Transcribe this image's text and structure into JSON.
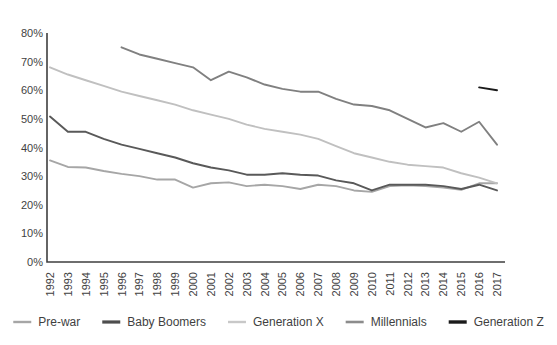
{
  "chart_data": {
    "type": "line",
    "title": "",
    "subtitle": "",
    "xlabel": "",
    "ylabel": "",
    "ylim": [
      0,
      0.8
    ],
    "grid": false,
    "legend_position": "bottom",
    "y_tick_labels": [
      "0%",
      "10%",
      "20%",
      "30%",
      "40%",
      "50%",
      "60%",
      "70%",
      "80%"
    ],
    "y_tick_values": [
      0,
      10,
      20,
      30,
      40,
      50,
      60,
      70,
      80
    ],
    "categories": [
      "1992",
      "1993",
      "1994",
      "1995",
      "1996",
      "1997",
      "1998",
      "1999",
      "2000",
      "2001",
      "2002",
      "2003",
      "2004",
      "2005",
      "2006",
      "2007",
      "2008",
      "2009",
      "2010",
      "2011",
      "2012",
      "2013",
      "2014",
      "2015",
      "2016",
      "2017"
    ],
    "series": [
      {
        "name": "Pre-war",
        "color": "#a6a6a6",
        "values": [
          35.5,
          33.2,
          33.0,
          31.8,
          30.8,
          30.0,
          28.8,
          28.8,
          26.0,
          27.5,
          27.8,
          26.5,
          27.0,
          26.5,
          25.5,
          27.0,
          26.5,
          25.0,
          24.5,
          26.5,
          26.8,
          26.5,
          26.0,
          25.2,
          27.5,
          27.5
        ]
      },
      {
        "name": "Baby Boomers",
        "color": "#595959",
        "values": [
          50.8,
          45.5,
          45.5,
          43.0,
          41.0,
          39.5,
          38.0,
          36.5,
          34.5,
          33.0,
          32.0,
          30.5,
          30.5,
          31.0,
          30.5,
          30.2,
          28.5,
          27.5,
          25.0,
          27.0,
          27.0,
          27.0,
          26.5,
          25.5,
          27.0,
          25.0
        ]
      },
      {
        "name": "Generation X",
        "color": "#c0c0c0",
        "values": [
          68.0,
          65.5,
          63.5,
          61.5,
          59.5,
          58.0,
          56.5,
          55.0,
          53.0,
          51.5,
          50.0,
          48.0,
          46.5,
          45.5,
          44.5,
          43.0,
          40.5,
          38.0,
          36.5,
          35.0,
          34.0,
          33.5,
          33.0,
          31.0,
          29.5,
          27.5
        ]
      },
      {
        "name": "Millennials",
        "color": "#808080",
        "start_year": "1996",
        "values": [
          null,
          null,
          null,
          null,
          75.0,
          72.5,
          71.0,
          69.5,
          68.0,
          63.5,
          66.5,
          64.5,
          62.0,
          60.5,
          59.5,
          59.5,
          57.0,
          55.0,
          54.5,
          53.0,
          50.0,
          47.0,
          48.5,
          45.5,
          49.0,
          41.0
        ]
      },
      {
        "name": "Generation Z",
        "color": "#1a1a1a",
        "start_year": "2016",
        "values": [
          null,
          null,
          null,
          null,
          null,
          null,
          null,
          null,
          null,
          null,
          null,
          null,
          null,
          null,
          null,
          null,
          null,
          null,
          null,
          null,
          null,
          null,
          null,
          null,
          61.0,
          60.0
        ]
      }
    ]
  },
  "legend": {
    "items": [
      {
        "label": "Pre-war",
        "color": "#a6a6a6",
        "thickness": 2.4
      },
      {
        "label": "Baby Boomers",
        "color": "#4d4d4d",
        "thickness": 3.2
      },
      {
        "label": "Generation X",
        "color": "#c8c8c8",
        "thickness": 2.4
      },
      {
        "label": "Millennials",
        "color": "#8c8c8c",
        "thickness": 2.6
      },
      {
        "label": "Generation Z",
        "color": "#1a1a1a",
        "thickness": 3.4
      }
    ]
  }
}
